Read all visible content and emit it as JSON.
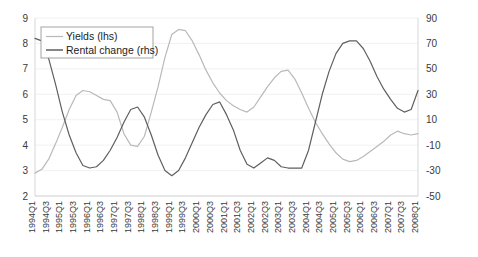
{
  "chart_data": {
    "type": "line",
    "title": "",
    "xlabel": "",
    "ylabel": "",
    "grid": true,
    "legend_position": "top-left",
    "axes": {
      "left": {
        "label": "Yields (lhs)",
        "ylim": [
          2,
          9
        ],
        "ticks": [
          2,
          3,
          4,
          5,
          6,
          7,
          8,
          9
        ],
        "tick_labels": [
          "2",
          "3",
          "4",
          "5",
          "6",
          "7",
          "8",
          "9"
        ]
      },
      "right": {
        "label": "Rental change (rhs)",
        "ylim": [
          -50,
          90
        ],
        "ticks": [
          -50,
          -30,
          -10,
          10,
          30,
          50,
          70,
          90
        ],
        "tick_labels": [
          "-50",
          "-30",
          "-10",
          "10",
          "30",
          "50",
          "70",
          "90"
        ]
      }
    },
    "x": [
      "1994Q1",
      "1994Q2",
      "1994Q3",
      "1994Q4",
      "1995Q1",
      "1995Q2",
      "1995Q3",
      "1995Q4",
      "1996Q1",
      "1996Q2",
      "1996Q3",
      "1996Q4",
      "1997Q1",
      "1997Q2",
      "1997Q3",
      "1997Q4",
      "1998Q1",
      "1998Q2",
      "1998Q3",
      "1998Q4",
      "1999Q1",
      "1999Q2",
      "1999Q3",
      "1999Q4",
      "2000Q1",
      "2000Q2",
      "2000Q3",
      "2000Q4",
      "2001Q1",
      "2001Q2",
      "2001Q3",
      "2001Q4",
      "2002Q1",
      "2002Q2",
      "2002Q3",
      "2002Q4",
      "2003Q1",
      "2003Q2",
      "2003Q3",
      "2003Q4",
      "2004Q1",
      "2004Q2",
      "2004Q3",
      "2004Q4",
      "2005Q1",
      "2005Q2",
      "2005Q3",
      "2005Q4",
      "2006Q1",
      "2006Q2",
      "2006Q3",
      "2006Q4",
      "2007Q1",
      "2007Q2",
      "2007Q3",
      "2007Q4",
      "2008Q1"
    ],
    "x_tick_labels": [
      "1994Q1",
      "1994Q3",
      "1995Q1",
      "1995Q3",
      "1996Q1",
      "1996Q3",
      "1997Q1",
      "1997Q3",
      "1998Q1",
      "1998Q3",
      "1999Q1",
      "1999Q3",
      "2000Q1",
      "2000Q3",
      "2001Q1",
      "2001Q3",
      "2002Q1",
      "2002Q3",
      "2003Q1",
      "2003Q3",
      "2004Q1",
      "2004Q3",
      "2005Q1",
      "2005Q3",
      "2006Q1",
      "2006Q3",
      "2007Q1",
      "2007Q3",
      "2008Q1"
    ],
    "series": [
      {
        "name": "Yields (lhs)",
        "axis": "left",
        "color": "#b9b9b9",
        "values": [
          2.9,
          3.05,
          3.45,
          4.05,
          4.7,
          5.4,
          5.95,
          6.15,
          6.1,
          5.95,
          5.8,
          5.75,
          5.3,
          4.45,
          4.0,
          3.95,
          4.35,
          5.3,
          6.3,
          7.45,
          8.35,
          8.55,
          8.5,
          8.1,
          7.55,
          6.95,
          6.45,
          6.05,
          5.75,
          5.55,
          5.4,
          5.3,
          5.5,
          5.9,
          6.3,
          6.65,
          6.9,
          6.95,
          6.6,
          6.05,
          5.45,
          4.9,
          4.45,
          4.05,
          3.7,
          3.45,
          3.35,
          3.4,
          3.55,
          3.75,
          3.95,
          4.15,
          4.4,
          4.55,
          4.45,
          4.4,
          4.45
        ],
        "annotations": {
          "max": 8.55,
          "max_at": "1999Q2",
          "min": 2.9,
          "min_at": "1994Q1",
          "end": 4.45
        }
      },
      {
        "name": "Rental change (rhs)",
        "axis": "right",
        "color": "#5f5f5f",
        "values": [
          74,
          72,
          58,
          38,
          16,
          -2,
          -16,
          -26,
          -28,
          -27,
          -22,
          -14,
          -4,
          8,
          18,
          20,
          12,
          -2,
          -18,
          -30,
          -34,
          -30,
          -20,
          -8,
          4,
          14,
          22,
          24,
          14,
          2,
          -14,
          -25,
          -28,
          -24,
          -20,
          -22,
          -27,
          -28,
          -28,
          -28,
          -14,
          8,
          30,
          48,
          62,
          70,
          72,
          72,
          66,
          56,
          44,
          34,
          26,
          19,
          16,
          18,
          33
        ],
        "annotations": {
          "max": 74,
          "max_at": "1994Q1",
          "min": -34,
          "min_at": "1999Q1",
          "end": 33
        }
      }
    ]
  },
  "legend": {
    "items": [
      {
        "label": "Yields (lhs)",
        "color": "#b9b9b9"
      },
      {
        "label": "Rental change (rhs)",
        "color": "#5f5f5f"
      }
    ]
  }
}
